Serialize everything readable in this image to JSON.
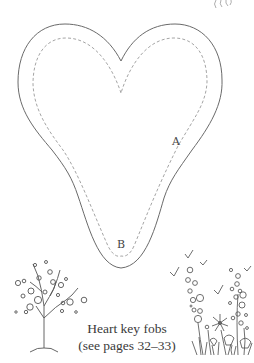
{
  "template": {
    "title": "Heart key fobs",
    "subtitle": "(see pages 32–33)",
    "markers": {
      "a": "A",
      "b": "B"
    }
  },
  "colors": {
    "outline": "#6a6a6a",
    "dashed": "#9a9a9a",
    "ink": "#3a3a3a",
    "background": "#ffffff"
  }
}
